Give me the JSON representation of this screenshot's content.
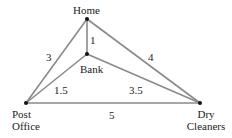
{
  "nodes": {
    "home": {
      "label": "Home"
    },
    "bank": {
      "label": "Bank"
    },
    "post_office": {
      "label_line1": "Post",
      "label_line2": "Office"
    },
    "dry_cleaners": {
      "label_line1": "Dry",
      "label_line2": "Cleaners"
    }
  },
  "edges": {
    "home_bank": "1",
    "home_post_office": "3",
    "home_dry_cleaners": "4",
    "bank_post_office": "1.5",
    "bank_dry_cleaners": "3.5",
    "post_office_dry_cleaners": "5"
  },
  "colors": {
    "edge": "#8a8a8a",
    "node": "#111111"
  }
}
